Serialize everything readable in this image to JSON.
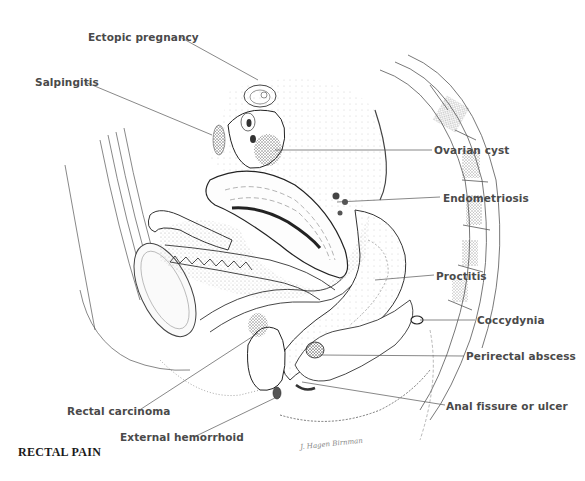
{
  "figure": {
    "title": "RECTAL PAIN",
    "signature": "J. Hagen Birnman",
    "labels": {
      "ectopic_pregnancy": "Ectopic pregnancy",
      "salpingitis": "Salpingitis",
      "ovarian_cyst": "Ovarian cyst",
      "endometriosis": "Endometriosis",
      "proctitis": "Proctitis",
      "coccydynia": "Coccydynia",
      "perirectal_abscess": "Perirectal abscess",
      "anal_fissure": "Anal fissure or ulcer",
      "rectal_carcinoma": "Rectal carcinoma",
      "external_hemorrhoid": "External hemorrhoid"
    },
    "colors": {
      "label_text": "#4a4a4a",
      "leader_line": "#555555",
      "ink": "#333333",
      "background": "#ffffff"
    }
  }
}
